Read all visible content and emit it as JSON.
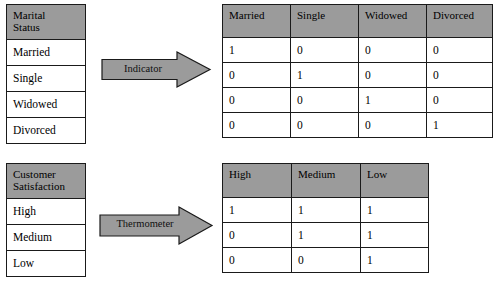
{
  "diagram": {
    "colors": {
      "header_fill": "#9b9b9b",
      "arrow_fill": "#9b9b9b",
      "border": "#1a1a1a",
      "cell_fill": "#ffffff"
    }
  },
  "groups": [
    {
      "name": "marital",
      "source": {
        "header": "Marital Status",
        "header_line1": "Marital",
        "header_line2": "Status",
        "rows": [
          "Married",
          "Single",
          "Widowed",
          "Divorced"
        ]
      },
      "arrow": {
        "label": "Indicator"
      },
      "encoded": {
        "headers": [
          "Married",
          "Single",
          "Widowed",
          "Divorced"
        ],
        "rows": [
          [
            "1",
            "0",
            "0",
            "0"
          ],
          [
            "0",
            "1",
            "0",
            "0"
          ],
          [
            "0",
            "0",
            "1",
            "0"
          ],
          [
            "0",
            "0",
            "0",
            "1"
          ]
        ]
      }
    },
    {
      "name": "satisfaction",
      "source": {
        "header": "Customer Satisfaction",
        "header_line1": "Customer",
        "header_line2": "Satisfaction",
        "rows": [
          "High",
          "Medium",
          "Low"
        ]
      },
      "arrow": {
        "label": "Thermometer"
      },
      "encoded": {
        "headers": [
          "High",
          "Medium",
          "Low"
        ],
        "rows": [
          [
            "1",
            "1",
            "1"
          ],
          [
            "0",
            "1",
            "1"
          ],
          [
            "0",
            "0",
            "1"
          ]
        ]
      }
    }
  ]
}
